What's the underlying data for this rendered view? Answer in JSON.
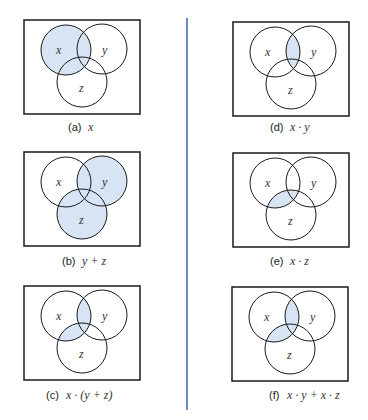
{
  "colors": {
    "shade": "#d6e4f3",
    "stroke": "#1a1a1a",
    "divider": "#3a63b8"
  },
  "panels": [
    {
      "id": "a",
      "caption_tag": "(a)",
      "expr": "x",
      "shaded": "x"
    },
    {
      "id": "b",
      "caption_tag": "(b)",
      "expr": "y + z",
      "shaded": "y+z"
    },
    {
      "id": "c",
      "caption_tag": "(c)",
      "expr": "x · (y + z)",
      "shaded": "x(y+z)"
    },
    {
      "id": "d",
      "caption_tag": "(d)",
      "expr": "x · y",
      "shaded": "xy"
    },
    {
      "id": "e",
      "caption_tag": "(e)",
      "expr": "x · z",
      "shaded": "xz"
    },
    {
      "id": "f",
      "caption_tag": "(f)",
      "expr": "x · y + x · z",
      "shaded": "xy+xz"
    }
  ],
  "labels": {
    "x": "x",
    "y": "y",
    "z": "z"
  }
}
